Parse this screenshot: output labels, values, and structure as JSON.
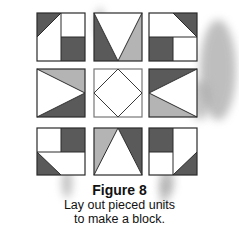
{
  "colors": {
    "dark": "#5a5a5a",
    "light": "#b4b4b4",
    "white": "#ffffff",
    "outline": "#2a2a2a",
    "center_outline": "#777777"
  },
  "figure": {
    "label": "Figure 8",
    "caption_line1": "Lay out pieced units",
    "caption_line2": "to make a block."
  },
  "blocks": [
    {
      "position": "top-left",
      "description": "left half: dark triangle top-left; right half: dark square bottom"
    },
    {
      "position": "top-center",
      "description": "white inverted triangle; dark left, light right"
    },
    {
      "position": "top-right",
      "description": "top half: dark triangle top-right; bottom half: dark square left"
    },
    {
      "position": "middle-left",
      "description": "white triangle pointing right; light top, dark bottom"
    },
    {
      "position": "center",
      "description": "white square with inscribed diamond"
    },
    {
      "position": "middle-right",
      "description": "white triangle pointing left; dark top, light bottom"
    },
    {
      "position": "bottom-left",
      "description": "top half: dark square right; bottom half: dark triangle bottom-left"
    },
    {
      "position": "bottom-center",
      "description": "white upward triangle; light left, dark right"
    },
    {
      "position": "bottom-right",
      "description": "left half: dark square top; right half: dark triangle bottom-right"
    }
  ]
}
